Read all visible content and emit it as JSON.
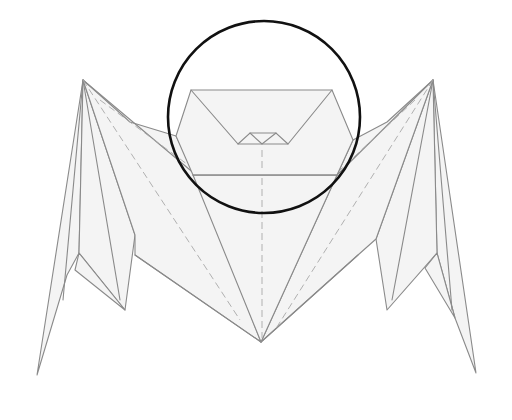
{
  "diagram": {
    "colors": {
      "paper_fill": "#f4f4f4",
      "fold_line": "#8a8a8a",
      "valley_line": "#a8a8a8",
      "highlight_circle": "#111111",
      "background": "#ffffff"
    },
    "highlight": {
      "shape": "circle",
      "target": "head",
      "cx": 264,
      "cy": 117,
      "r": 96
    },
    "parts": [
      "head",
      "body",
      "left-wing",
      "right-wing",
      "nose"
    ]
  }
}
